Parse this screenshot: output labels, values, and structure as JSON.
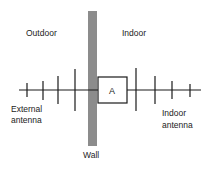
{
  "diagram": {
    "labels": {
      "outdoor": "Outdoor",
      "indoor": "Indoor",
      "external_antenna_line1": "External",
      "external_antenna_line2": "antenna",
      "indoor_antenna_line1": "Indoor",
      "indoor_antenna_line2": "antenna",
      "wall": "Wall",
      "box": "A"
    },
    "colors": {
      "wall": "#8c8c8c",
      "line": "#1a1a1a",
      "background": "#ffffff"
    }
  }
}
